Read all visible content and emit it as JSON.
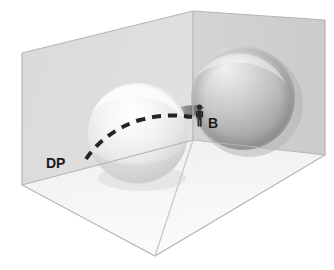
{
  "figure": {
    "title": "",
    "background_color": "#ffffff",
    "view": "three-dimensional box containing two tangent spheres",
    "canvas": {
      "width": 334,
      "height": 270
    }
  },
  "labels": [
    {
      "id": "dp",
      "text": "DP",
      "name": "label-dp",
      "x": 46,
      "y": 168,
      "font_size": 14,
      "color": "#1b1b1b",
      "meaning": "dashed path marker"
    },
    {
      "id": "b",
      "text": "B",
      "name": "label-b",
      "x": 208,
      "y": 128,
      "font_size": 14,
      "color": "#1b1b1b",
      "meaning": "bridge / neck point marker"
    }
  ],
  "box": {
    "name": "transparent-box",
    "left_wall_color": "#dcdcdc",
    "back_wall_color": "#d2d2d2",
    "right_wall_color": "#cfcfcf",
    "floor_color": "#f4f4f4",
    "edge_color": "#b9b9b9",
    "top_corner": {
      "x": 193,
      "y": 11
    },
    "left_top": {
      "x": 22,
      "y": 53
    },
    "right_top": {
      "x": 325,
      "y": 20
    },
    "front_bottom": {
      "x": 155,
      "y": 256
    },
    "left_bottom": {
      "x": 22,
      "y": 185
    },
    "right_bottom": {
      "x": 325,
      "y": 155
    }
  },
  "spheres": [
    {
      "id": "left-sphere",
      "name": "sphere-left-light",
      "cx": 138,
      "cy": 133,
      "r": 50,
      "fill_light": "#f7f7f7",
      "fill_mid": "#e2e2e2",
      "fill_shadow": "#c6c6c6",
      "tone": "light"
    },
    {
      "id": "right-sphere",
      "name": "sphere-right-dark",
      "cx": 243,
      "cy": 98,
      "r": 52,
      "fill_light": "#e6e6e6",
      "fill_mid": "#c4c4c4",
      "fill_shadow": "#9f9f9f",
      "tone": "dark"
    }
  ],
  "dashed_path": {
    "name": "dashed-path-dp",
    "color": "#232323",
    "stroke_width": 4,
    "dash_pattern": "9 7",
    "points": "86,159 98,143 116,128 140,119 166,116 190,117"
  },
  "bridge": {
    "name": "sphere-bridge-neck",
    "color": "#6f6f6f",
    "x": 178,
    "y": 113,
    "width": 24,
    "height": 14
  },
  "human_figure": {
    "name": "human-silhouette-icon",
    "color": "#2a2a2a",
    "x": 196,
    "y": 105,
    "height": 22,
    "description": "small standing person for scale at bridge point B"
  }
}
